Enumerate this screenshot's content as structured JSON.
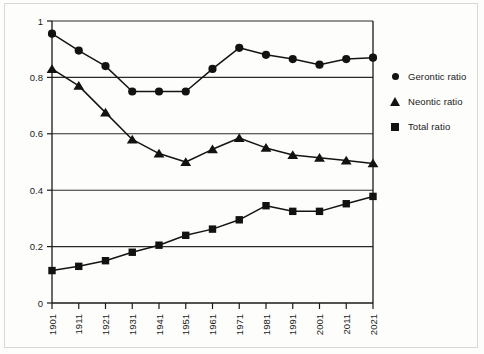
{
  "chart_data": {
    "type": "line",
    "title": "",
    "xlabel": "",
    "ylabel": "",
    "grid": true,
    "legend_position": "right",
    "ylim": [
      0,
      1
    ],
    "yticks": [
      "0",
      "0.2",
      "0.4",
      "0.6",
      "0.8",
      "1"
    ],
    "ytick_values": [
      0,
      0.2,
      0.4,
      0.6,
      0.8,
      1
    ],
    "categories": [
      "1901",
      "1911",
      "1921",
      "1931",
      "1941",
      "1951",
      "1961",
      "1971",
      "1981",
      "1991",
      "2001",
      "2011",
      "2021"
    ],
    "series": [
      {
        "name": "Gerontic ratio",
        "marker": "circle",
        "values": [
          0.955,
          0.895,
          0.84,
          0.75,
          0.75,
          0.75,
          0.83,
          0.905,
          0.88,
          0.865,
          0.845,
          0.865,
          0.87
        ]
      },
      {
        "name": "Neontic ratio",
        "marker": "triangle",
        "values": [
          0.83,
          0.77,
          0.675,
          0.58,
          0.53,
          0.5,
          0.545,
          0.585,
          0.55,
          0.525,
          0.515,
          0.505,
          0.495
        ]
      },
      {
        "name": "Total ratio",
        "marker": "square",
        "values": [
          0.115,
          0.13,
          0.15,
          0.18,
          0.205,
          0.24,
          0.262,
          0.295,
          0.345,
          0.325,
          0.325,
          0.352,
          0.378
        ]
      }
    ]
  },
  "legend": {
    "items": [
      {
        "label": "Gerontic ratio",
        "marker": "circle"
      },
      {
        "label": "Neontic ratio",
        "marker": "triangle"
      },
      {
        "label": "Total ratio",
        "marker": "square"
      }
    ]
  },
  "colors": {
    "line": "#141414",
    "marker": "#121212",
    "grid": "#2b2b2b",
    "axis": "#1a1a1a",
    "background": "#fdfdfb"
  }
}
